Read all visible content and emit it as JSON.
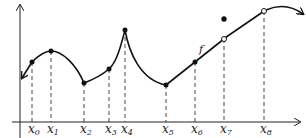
{
  "diagram": {
    "function_label": "f",
    "x_labels": [
      {
        "name": "x",
        "sub": "0",
        "x": 32
      },
      {
        "name": "x",
        "sub": "1",
        "x": 51
      },
      {
        "name": "x",
        "sub": "2",
        "x": 84
      },
      {
        "name": "x",
        "sub": "3",
        "x": 109
      },
      {
        "name": "x",
        "sub": "4",
        "x": 125
      },
      {
        "name": "x",
        "sub": "5",
        "x": 166
      },
      {
        "name": "x",
        "sub": "6",
        "x": 195
      },
      {
        "name": "x",
        "sub": "7",
        "x": 224
      },
      {
        "name": "x",
        "sub": "8",
        "x": 264
      }
    ],
    "points": [
      {
        "label": "x0",
        "x": 32,
        "y": 62,
        "style": "filled"
      },
      {
        "label": "x1",
        "x": 51,
        "y": 51,
        "style": "filled"
      },
      {
        "label": "x2",
        "x": 84,
        "y": 83,
        "style": "filled"
      },
      {
        "label": "x3",
        "x": 109,
        "y": 69,
        "style": "filled"
      },
      {
        "label": "x4",
        "x": 125,
        "y": 30,
        "style": "filled"
      },
      {
        "label": "x5",
        "x": 166,
        "y": 85,
        "style": "filled"
      },
      {
        "label": "x6",
        "x": 195,
        "y": 62,
        "style": "filled"
      },
      {
        "label": "x7",
        "x": 224,
        "y": 39,
        "style": "open"
      },
      {
        "label": "x7-value",
        "x": 224,
        "y": 19,
        "style": "filled"
      },
      {
        "label": "x8",
        "x": 264,
        "y": 11,
        "style": "open"
      }
    ],
    "colors": {
      "stroke": "#111111",
      "background": "#ffffff"
    }
  }
}
